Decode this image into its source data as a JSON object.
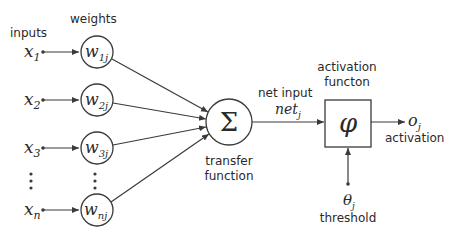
{
  "labels": {
    "inputs": "inputs",
    "weights": "weights",
    "net_input": "net input",
    "transfer_function_1": "transfer",
    "transfer_function_2": "function",
    "activation_function_1": "activation",
    "activation_function_2": "functon",
    "activation": "activation",
    "threshold": "threshold"
  },
  "inputs": [
    {
      "base": "x",
      "sub": "1",
      "y": 52
    },
    {
      "base": "x",
      "sub": "2",
      "y": 100
    },
    {
      "base": "x",
      "sub": "3",
      "y": 148
    },
    {
      "base": "x",
      "sub": "n",
      "y": 210
    }
  ],
  "weights": [
    {
      "base": "w",
      "sub": "1j",
      "y": 52
    },
    {
      "base": "w",
      "sub": "2j",
      "y": 100
    },
    {
      "base": "w",
      "sub": "3j",
      "y": 148
    },
    {
      "base": "w",
      "sub": "nj",
      "y": 210
    }
  ],
  "symbols": {
    "sum": "Σ",
    "phi": "φ",
    "net_base": "net",
    "net_sub": "j",
    "output_base": "o",
    "output_sub": "j",
    "theta_base": "θ",
    "theta_sub": "j"
  },
  "colors": {
    "line": "#3a3a3a",
    "text": "#2a2a2a",
    "background": "#ffffff"
  }
}
